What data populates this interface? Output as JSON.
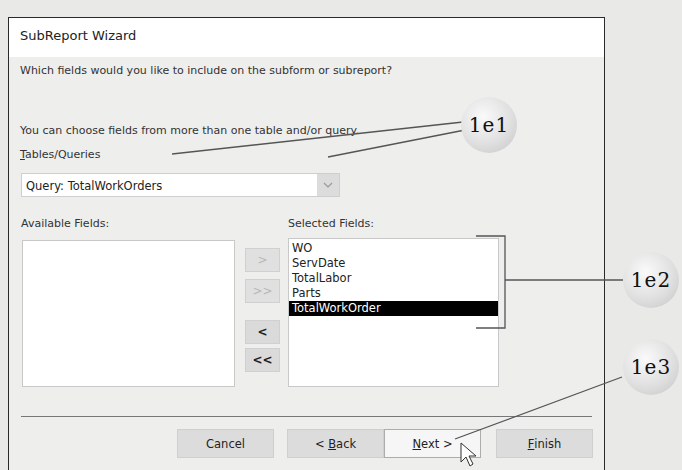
{
  "dialog": {
    "title": "SubReport Wizard",
    "prompt": "Which fields would you like to include on the subform or subreport?",
    "hint": "You can choose fields from more than one table and/or query.",
    "tables_label_first": "T",
    "tables_label_rest": "ables/Queries",
    "tables_value": "Query: TotalWorkOrders",
    "available_label": "Available Fields:",
    "selected_label": "Selected Fields:",
    "available_fields": [],
    "selected_fields": [
      "WO",
      "ServDate",
      "TotalLabor",
      "Parts",
      "TotalWorkOrder"
    ],
    "selected_index": 4,
    "move_buttons": {
      "add_one": ">",
      "add_all": ">>",
      "remove_one": "<",
      "remove_all": "<<"
    },
    "buttons": {
      "cancel": "Cancel",
      "back_prefix": "< ",
      "back_u": "B",
      "back_rest": "ack",
      "next_u": "N",
      "next_rest": "ext >",
      "finish_u": "F",
      "finish_rest": "inish"
    }
  },
  "callouts": {
    "c1": "1e1",
    "c2": "1e2",
    "c3": "1e3"
  },
  "icons": {
    "dropdown": "chevron-down-icon",
    "cursor": "mouse-pointer-icon"
  }
}
